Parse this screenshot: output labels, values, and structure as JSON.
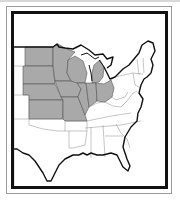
{
  "map": {
    "title": "United States (Eastern half) — Midwest region highlighted",
    "highlight_color": "#a9a9a9",
    "border_color": "#111111",
    "state_line_color": "#8a8a8a",
    "highlighted_states": [
      "North Dakota",
      "South Dakota",
      "Nebraska",
      "Kansas",
      "Minnesota",
      "Iowa",
      "Missouri",
      "Wisconsin",
      "Illinois",
      "Michigan",
      "Indiana",
      "Ohio"
    ]
  }
}
